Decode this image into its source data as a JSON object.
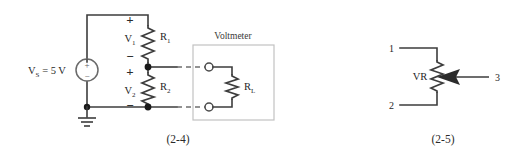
{
  "figure": {
    "background_color": "#ffffff",
    "line_color": "#3d3d3d",
    "box_border_color": "#c2c2c2"
  },
  "circuit_2_4": {
    "caption": "(2-4)",
    "source": {
      "label": "V",
      "label_sub": "S",
      "label_value": " = 5 V",
      "plus_sign": "+",
      "minus_sign": "−",
      "symbol": "dc-voltage-source"
    },
    "resistor_r1": {
      "label": "R",
      "label_sub": "1",
      "voltage_label": "V",
      "voltage_sub": "1",
      "plus_sign": "+",
      "minus_sign": "−"
    },
    "resistor_r2": {
      "label": "R",
      "label_sub": "2",
      "voltage_label": "V",
      "voltage_sub": "2",
      "plus_sign": "+",
      "minus_sign": "−"
    },
    "voltmeter": {
      "title": "Voltmeter",
      "load_label": "R",
      "load_sub": "L"
    },
    "ground": {
      "symbol": "earth-ground"
    }
  },
  "circuit_2_5": {
    "caption": "(2-5)",
    "component_label": "VR",
    "terminal_1": "1",
    "terminal_2": "2",
    "terminal_3": "3",
    "symbol": "variable-resistor-potentiometer"
  }
}
